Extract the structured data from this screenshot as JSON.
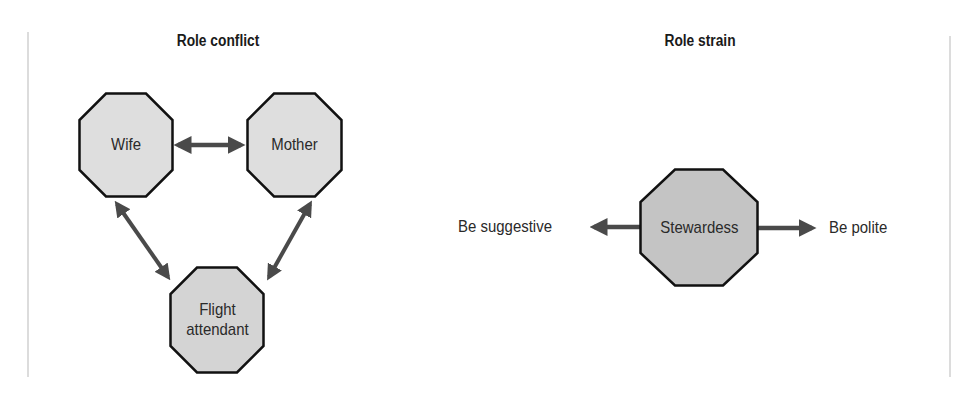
{
  "colors": {
    "arrow": "#4a4a4a",
    "node_fill_light": "#dedede",
    "node_fill_dark": "#c4c4c4",
    "node_stroke": "#111111",
    "frame": "#dcdcdc"
  },
  "panels": [
    {
      "title": "Role conflict",
      "nodes": [
        {
          "id": "wife",
          "label": "Wife"
        },
        {
          "id": "mother",
          "label": "Mother"
        },
        {
          "id": "flight-attendant",
          "label": "Flight\nattendant"
        }
      ],
      "edges": [
        {
          "from": "wife",
          "to": "mother",
          "type": "bidirectional"
        },
        {
          "from": "wife",
          "to": "flight-attendant",
          "type": "bidirectional"
        },
        {
          "from": "mother",
          "to": "flight-attendant",
          "type": "bidirectional"
        }
      ]
    },
    {
      "title": "Role strain",
      "nodes": [
        {
          "id": "stewardess",
          "label": "Stewardess"
        }
      ],
      "outcomes": [
        {
          "label": "Be suggestive",
          "direction": "left"
        },
        {
          "label": "Be polite",
          "direction": "right"
        }
      ]
    }
  ]
}
